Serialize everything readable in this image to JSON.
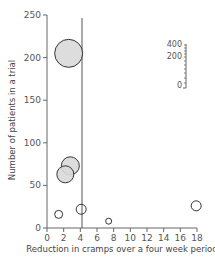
{
  "chart_data": {
    "type": "scatter",
    "subtype": "bubble",
    "title": "",
    "xlabel": "Reduction in cramps over a four week period",
    "ylabel": "Number of patients in a trial",
    "xlim": [
      0,
      18
    ],
    "ylim": [
      0,
      250
    ],
    "x_ticks": [
      0,
      2,
      4,
      6,
      8,
      10,
      12,
      14,
      16,
      18
    ],
    "y_ticks": [
      0,
      50,
      100,
      150,
      200,
      250
    ],
    "grid": false,
    "reference_line": {
      "orientation": "vertical",
      "x": 4.2
    },
    "points": [
      {
        "x": 2.6,
        "y": 205,
        "size_radius_px": 14,
        "filled": true
      },
      {
        "x": 2.8,
        "y": 73,
        "size_radius_px": 9,
        "filled": true
      },
      {
        "x": 2.2,
        "y": 63,
        "size_radius_px": 8.5,
        "filled": true
      },
      {
        "x": 1.4,
        "y": 16,
        "size_radius_px": 4,
        "filled": false
      },
      {
        "x": 4.1,
        "y": 22,
        "size_radius_px": 5,
        "filled": false
      },
      {
        "x": 7.4,
        "y": 8,
        "size_radius_px": 3,
        "filled": false
      },
      {
        "x": 17.9,
        "y": 26,
        "size_radius_px": 5,
        "filled": false
      }
    ],
    "inset_scale": {
      "tick_labels": [
        "400",
        "200",
        "0"
      ],
      "description": "size scale for bubble area"
    }
  },
  "colors": {
    "fill": "#d9d9d9",
    "stroke": "#333333",
    "axis": "#666666"
  }
}
